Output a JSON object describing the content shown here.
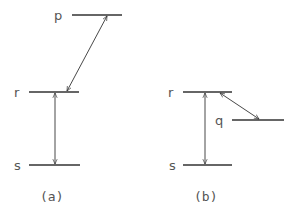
{
  "diagram": {
    "panels": [
      {
        "caption": "(a)",
        "levels": [
          {
            "label": "p",
            "x1": 72,
            "x2": 122,
            "y": 15
          },
          {
            "label": "r",
            "x1": 29,
            "x2": 79,
            "y": 92
          },
          {
            "label": "s",
            "x1": 29,
            "x2": 80,
            "y": 165
          }
        ],
        "transitions": [
          {
            "from": "r",
            "to": "p",
            "type": "double-arrow",
            "x1": 67,
            "y1": 92,
            "x2": 107,
            "y2": 16
          },
          {
            "from": "s",
            "to": "r",
            "type": "double-arrow",
            "x1": 55,
            "y1": 164,
            "x2": 55,
            "y2": 93
          }
        ]
      },
      {
        "caption": "(b)",
        "levels": [
          {
            "label": "r",
            "x1": 183,
            "x2": 232,
            "y": 92
          },
          {
            "label": "q",
            "x1": 232,
            "x2": 284,
            "y": 120
          },
          {
            "label": "s",
            "x1": 183,
            "x2": 232,
            "y": 165
          }
        ],
        "transitions": [
          {
            "from": "r",
            "to": "q",
            "type": "double-arrow",
            "x1": 220,
            "y1": 93,
            "x2": 259,
            "y2": 119
          },
          {
            "from": "s",
            "to": "r",
            "type": "double-arrow",
            "x1": 205,
            "y1": 164,
            "x2": 205,
            "y2": 93
          }
        ]
      }
    ],
    "labels": {
      "a_p": "p",
      "a_r": "r",
      "a_s": "s",
      "a_caption": "(a)",
      "b_r": "r",
      "b_q": "q",
      "b_s": "s",
      "b_caption": "(b)"
    }
  }
}
